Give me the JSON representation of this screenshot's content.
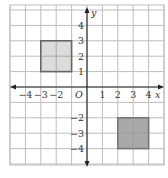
{
  "diagram": {
    "type": "coordinate-plane",
    "axes": {
      "x_label": "x",
      "y_label": "y",
      "origin_label": "O",
      "x_ticks": [
        {
          "value": -4,
          "label": "−4"
        },
        {
          "value": -3,
          "label": "−3"
        },
        {
          "value": -2,
          "label": "−2"
        },
        {
          "value": 1,
          "label": "1"
        },
        {
          "value": 2,
          "label": "2"
        },
        {
          "value": 3,
          "label": "3"
        },
        {
          "value": 4,
          "label": "4"
        }
      ],
      "y_ticks": [
        {
          "value": 4,
          "label": "4"
        },
        {
          "value": 3,
          "label": "3"
        },
        {
          "value": 2,
          "label": "2"
        },
        {
          "value": 1,
          "label": "1"
        },
        {
          "value": -2,
          "label": "−2"
        },
        {
          "value": -3,
          "label": "−3"
        },
        {
          "value": -4,
          "label": "−4"
        }
      ]
    },
    "shapes": [
      {
        "name": "square-upper-left",
        "x1": -3,
        "y1": 1,
        "x2": -1,
        "y2": 3,
        "fill": "#dcdcdc",
        "stroke": "#666666"
      },
      {
        "name": "square-lower-right",
        "x1": 2,
        "y1": -4,
        "x2": 4,
        "y2": -2,
        "fill": "#a9a9a9",
        "stroke": "#777777"
      }
    ],
    "colors": {
      "grid": "#bdbdbd",
      "axis": "#222222"
    }
  }
}
